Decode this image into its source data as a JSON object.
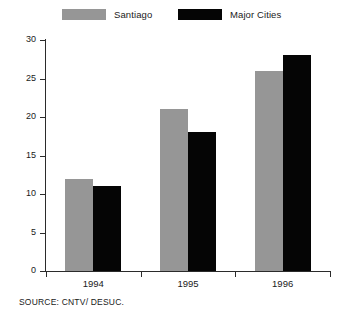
{
  "chart_data": {
    "type": "bar",
    "title": "",
    "xlabel": "",
    "ylabel": "",
    "categories": [
      "1994",
      "1995",
      "1996"
    ],
    "series": [
      {
        "name": "Santiago",
        "color": "#969696",
        "values": [
          12,
          21,
          26
        ]
      },
      {
        "name": "Major Cities",
        "color": "#050505",
        "values": [
          11,
          18,
          28
        ]
      }
    ],
    "ylim": [
      0,
      30
    ],
    "ytick_step": 5,
    "yticks": [
      0,
      5,
      10,
      15,
      20,
      25,
      30
    ],
    "ytick_labels": [
      "0",
      "5",
      "10",
      "15",
      "20",
      "25",
      "30"
    ],
    "grid": false,
    "legend_position": "top"
  },
  "legend": {
    "items": [
      {
        "label": "Santiago",
        "swatch": "#969696"
      },
      {
        "label": "Major Cities",
        "swatch": "#050505"
      }
    ]
  },
  "footer": {
    "source": "SOURCE: CNTV/ DESUC."
  }
}
